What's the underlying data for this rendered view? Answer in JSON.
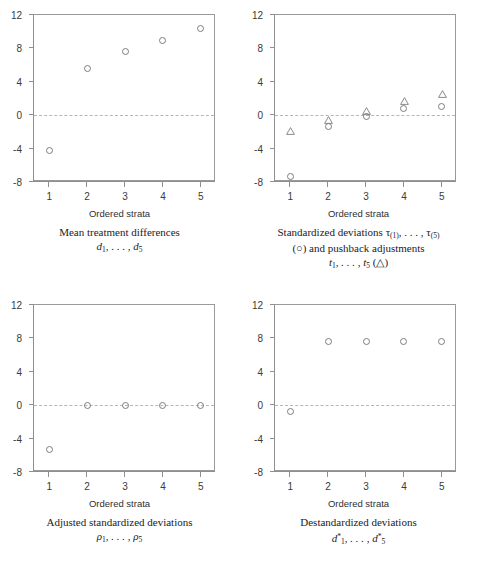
{
  "figure": {
    "x_axis_title": "Ordered strata",
    "x_ticks": [
      "1",
      "2",
      "3",
      "4",
      "5"
    ],
    "y_ticks": [
      "12",
      "8",
      "4",
      "0",
      "-4",
      "-8"
    ],
    "marker_circle": "circle-marker",
    "marker_triangle": "triangle-marker",
    "colors": {
      "marker_stroke": "#7d7d7d",
      "axis": "#8f8f8f",
      "zero_line": "#b6b6b6",
      "text": "#222222",
      "background": "#ffffff"
    }
  },
  "panels": [
    {
      "id": "mean-treatment-differences",
      "caption_line1": "Mean treatment differences",
      "caption_line2_base": "d",
      "caption_line2_sub_first": "1",
      "caption_line2_mid": ", . . . , ",
      "caption_line2_sub_last": "5"
    },
    {
      "id": "standardized-deviations",
      "caption_line1_a": "Standardized deviations τ",
      "caption_line1_sub1": "(1)",
      "caption_line1_mid": ", . . . , τ",
      "caption_line1_sub2": "(5)",
      "caption_line2": "(○) and pushback adjustments",
      "caption_line3_base": "t",
      "caption_line3_sub_first": "1",
      "caption_line3_mid": ", . . . , t",
      "caption_line3_sub_last": "5",
      "caption_line3_tail": " (△)"
    },
    {
      "id": "adjusted-standardized-deviations",
      "caption_line1": "Adjusted standardized deviations",
      "caption_line2_base": "ρ",
      "caption_line2_sub_first": "1",
      "caption_line2_mid": ", . . . , ρ",
      "caption_line2_sub_last": "5"
    },
    {
      "id": "destandardized-deviations",
      "caption_line1": "Destandardized deviations",
      "caption_line2_base": "d",
      "caption_line2_sub_first": "1",
      "caption_line2_mid": ", . . . , d",
      "caption_line2_sub_last": "5",
      "caption_line2_star": "*"
    }
  ],
  "chart_data": [
    {
      "type": "scatter",
      "panel": "top-left",
      "title": "Mean treatment differences d1, ..., d5",
      "xlabel": "Ordered strata",
      "ylabel": "",
      "xlim": [
        0.6,
        5.4
      ],
      "ylim": [
        -8,
        12
      ],
      "xticks": [
        1,
        2,
        3,
        4,
        5
      ],
      "yticks": [
        -8,
        -4,
        0,
        4,
        8,
        12
      ],
      "grid": false,
      "zero_reference_line": 0,
      "legend": "none",
      "series": [
        {
          "name": "d",
          "marker": "circle",
          "x": [
            1,
            2,
            3,
            4,
            5
          ],
          "values": [
            -4.2,
            5.6,
            7.6,
            8.9,
            10.4
          ]
        }
      ]
    },
    {
      "type": "scatter",
      "panel": "top-right",
      "title": "Standardized deviations tau(1), ..., tau(5) and pushback adjustments t1, ..., t5",
      "xlabel": "Ordered strata",
      "ylabel": "",
      "xlim": [
        0.6,
        5.4
      ],
      "ylim": [
        -8,
        12
      ],
      "xticks": [
        1,
        2,
        3,
        4,
        5
      ],
      "yticks": [
        -8,
        -4,
        0,
        4,
        8,
        12
      ],
      "grid": false,
      "zero_reference_line": 0,
      "legend": "in-caption",
      "series": [
        {
          "name": "tau",
          "marker": "circle",
          "x": [
            1,
            2,
            3,
            4,
            5
          ],
          "values": [
            -7.4,
            -1.3,
            -0.1,
            0.8,
            1.0
          ]
        },
        {
          "name": "t",
          "marker": "triangle",
          "x": [
            1,
            2,
            3,
            4,
            5
          ],
          "values": [
            -2.3,
            -0.9,
            0.1,
            1.3,
            2.2
          ]
        }
      ]
    },
    {
      "type": "scatter",
      "panel": "bottom-left",
      "title": "Adjusted standardized deviations rho1, ..., rho5",
      "xlabel": "Ordered strata",
      "ylabel": "",
      "xlim": [
        0.6,
        5.4
      ],
      "ylim": [
        -8,
        12
      ],
      "xticks": [
        1,
        2,
        3,
        4,
        5
      ],
      "yticks": [
        -8,
        -4,
        0,
        4,
        8,
        12
      ],
      "grid": false,
      "zero_reference_line": 0,
      "legend": "none",
      "series": [
        {
          "name": "rho",
          "marker": "circle",
          "x": [
            1,
            2,
            3,
            4,
            5
          ],
          "values": [
            -5.3,
            0.0,
            0.0,
            0.0,
            0.0
          ]
        }
      ]
    },
    {
      "type": "scatter",
      "panel": "bottom-right",
      "title": "Destandardized deviations d*1, ..., d*5",
      "xlabel": "Ordered strata",
      "ylabel": "",
      "xlim": [
        0.6,
        5.4
      ],
      "ylim": [
        -8,
        12
      ],
      "xticks": [
        1,
        2,
        3,
        4,
        5
      ],
      "yticks": [
        -8,
        -4,
        0,
        4,
        8,
        12
      ],
      "grid": false,
      "zero_reference_line": 0,
      "legend": "none",
      "series": [
        {
          "name": "d-star",
          "marker": "circle",
          "x": [
            1,
            2,
            3,
            4,
            5
          ],
          "values": [
            -0.7,
            7.6,
            7.6,
            7.6,
            7.6
          ]
        }
      ]
    }
  ]
}
